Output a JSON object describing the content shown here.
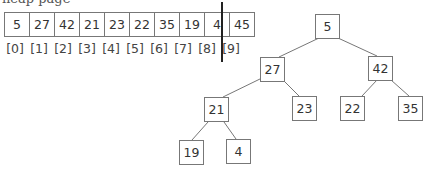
{
  "header": {
    "clipped_text": "heap page"
  },
  "array": {
    "values": [
      "5",
      "27",
      "42",
      "21",
      "23",
      "22",
      "35",
      "19",
      "4",
      "45"
    ],
    "indices": [
      "[0]",
      "[1]",
      "[2]",
      "[3]",
      "[4]",
      "[5]",
      "[6]",
      "[7]",
      "[8]",
      "[9]"
    ],
    "divider_after_index": 8
  },
  "tree": {
    "nodes": [
      {
        "id": "n0",
        "label": "5",
        "x": 315,
        "y": 14
      },
      {
        "id": "n1",
        "label": "27",
        "x": 260,
        "y": 57
      },
      {
        "id": "n2",
        "label": "42",
        "x": 368,
        "y": 56
      },
      {
        "id": "n3",
        "label": "21",
        "x": 204,
        "y": 97
      },
      {
        "id": "n4",
        "label": "23",
        "x": 292,
        "y": 96
      },
      {
        "id": "n5",
        "label": "22",
        "x": 340,
        "y": 96
      },
      {
        "id": "n6",
        "label": "35",
        "x": 398,
        "y": 96
      },
      {
        "id": "n7",
        "label": "19",
        "x": 179,
        "y": 140
      },
      {
        "id": "n8",
        "label": "4",
        "x": 226,
        "y": 139
      }
    ],
    "edges": [
      [
        "5",
        "27"
      ],
      [
        "5",
        "42"
      ],
      [
        "27",
        "21"
      ],
      [
        "27",
        "23"
      ],
      [
        "42",
        "22"
      ],
      [
        "42",
        "35"
      ],
      [
        "21",
        "19"
      ],
      [
        "21",
        "4"
      ]
    ]
  }
}
